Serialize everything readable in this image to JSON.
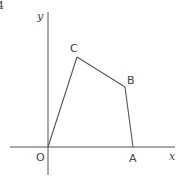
{
  "figure": {
    "number_label": "4",
    "axes": {
      "x_label": "x",
      "y_label": "y",
      "origin_label": "O"
    },
    "points": {
      "O": {
        "label": "O",
        "px": [
          48,
          147
        ]
      },
      "A": {
        "label": "A",
        "px": [
          133,
          147
        ]
      },
      "B": {
        "label": "B",
        "px": [
          125,
          87
        ]
      },
      "C": {
        "label": "C",
        "px": [
          77,
          57
        ]
      }
    },
    "polygon_order": [
      "O",
      "C",
      "B",
      "A"
    ],
    "line_color": "#555555",
    "text_color": "#444444"
  }
}
